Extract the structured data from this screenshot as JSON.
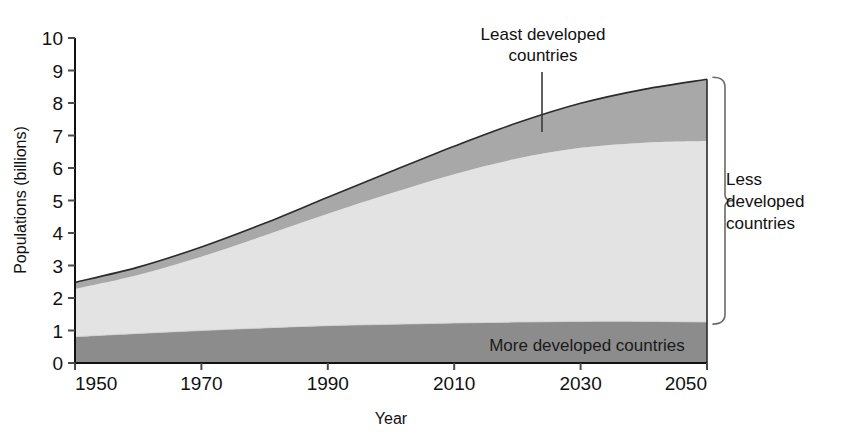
{
  "chart_data": {
    "type": "area",
    "title": "",
    "xlabel": "Year",
    "ylabel": "Populations (billions)",
    "xlim": [
      1950,
      2050
    ],
    "ylim": [
      0,
      10
    ],
    "xticks": [
      1950,
      1970,
      1990,
      2010,
      2030,
      2050
    ],
    "yticks": [
      0,
      1,
      2,
      3,
      4,
      5,
      6,
      7,
      8,
      9,
      10
    ],
    "grid": false,
    "legend_position": "in-plot-annotations",
    "stacked": true,
    "x": [
      1950,
      1960,
      1970,
      1980,
      1990,
      2000,
      2010,
      2020,
      2030,
      2040,
      2050
    ],
    "series": [
      {
        "name": "More developed countries",
        "color": "#8c8c8c",
        "values": [
          0.81,
          0.91,
          1.0,
          1.08,
          1.15,
          1.19,
          1.23,
          1.26,
          1.28,
          1.28,
          1.26
        ]
      },
      {
        "name": "Less developed countries",
        "color": "#e3e3e3",
        "values": [
          1.47,
          1.8,
          2.27,
          2.84,
          3.44,
          4.03,
          4.58,
          5.03,
          5.34,
          5.5,
          5.57
        ]
      },
      {
        "name": "Least developed countries",
        "color": "#a8a8a8",
        "values": [
          0.2,
          0.24,
          0.3,
          0.38,
          0.51,
          0.67,
          0.86,
          1.1,
          1.37,
          1.64,
          1.9
        ]
      }
    ],
    "totals": [
      2.48,
      2.95,
      3.57,
      4.3,
      5.1,
      5.89,
      6.67,
      7.39,
      7.99,
      8.42,
      8.73
    ],
    "annotations": [
      {
        "id": "least-developed",
        "text_lines": [
          "Least developed",
          "countries"
        ],
        "points_to_year": 2021,
        "points_to_value": 7.3
      },
      {
        "id": "more-developed",
        "text_lines": [
          "More developed countries"
        ],
        "inside_band": "More developed countries"
      },
      {
        "id": "less-developed-bracket",
        "text_lines": [
          "Less",
          "developed",
          "countries"
        ],
        "spans_value_from": 1.26,
        "spans_value_to": 8.73
      }
    ]
  },
  "axes": {
    "y_title": "Populations (billions)",
    "x_title": "Year",
    "y_tick_labels": [
      "10",
      "9",
      "8",
      "7",
      "6",
      "5",
      "4",
      "3",
      "2",
      "1",
      "0"
    ],
    "x_tick_labels": [
      "1950",
      "1970",
      "1990",
      "2010",
      "2030",
      "2050"
    ]
  },
  "labels": {
    "least_developed_line1": "Least developed",
    "least_developed_line2": "countries",
    "more_developed": "More developed countries",
    "less_developed_line1": "Less",
    "less_developed_line2": "developed",
    "less_developed_line3": "countries"
  },
  "colors": {
    "more_developed_band": "#8c8c8c",
    "less_developed_band": "#e3e3e3",
    "least_developed_band": "#a8a8a8",
    "outline": "#2b2b2b",
    "axis": "#111111",
    "background": "#ffffff"
  }
}
